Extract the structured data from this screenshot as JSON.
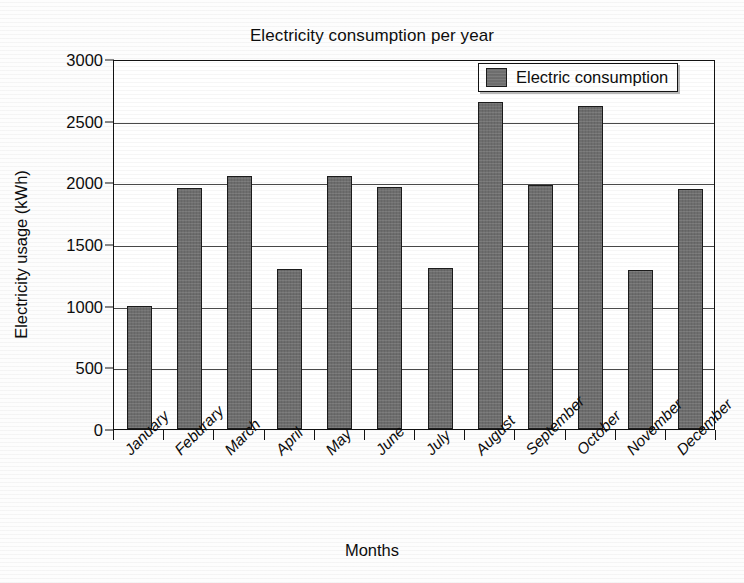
{
  "chart_data": {
    "type": "bar",
    "title": "Electricity consumption per year",
    "xlabel": "Months",
    "ylabel": "Electricity usage (kWh)",
    "categories": [
      "January",
      "Feburary",
      "March",
      "April",
      "May",
      "June",
      "July",
      "August",
      "September",
      "October",
      "November",
      "December"
    ],
    "values": [
      1000,
      1955,
      2055,
      1300,
      2050,
      1965,
      1305,
      2650,
      1980,
      2615,
      1290,
      1950
    ],
    "series": [
      {
        "name": "Electric consumption",
        "values": [
          1000,
          1955,
          2055,
          1300,
          2050,
          1965,
          1305,
          2650,
          1980,
          2615,
          1290,
          1950
        ]
      }
    ],
    "ylim": [
      0,
      3000
    ],
    "ytick_labels": [
      "0",
      "500",
      "1000",
      "1500",
      "2000",
      "2500",
      "3000"
    ],
    "ytick_values": [
      0,
      500,
      1000,
      1500,
      2000,
      2500,
      3000
    ],
    "grid": "horizontal",
    "legend_position": "top-right",
    "legend_entries": [
      "Electric consumption"
    ],
    "bar_color": "#6e6e6e",
    "bar_edge_color": "#1c1c1c",
    "axis_color": "#121212",
    "grid_color": "#4a4a4a",
    "background_color": "#ffffff"
  },
  "legend": {
    "label": "Electric consumption"
  }
}
